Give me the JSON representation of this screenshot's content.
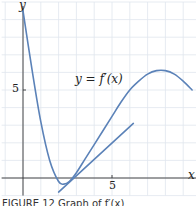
{
  "chart_data": {
    "type": "line",
    "title": "",
    "xlabel": "x",
    "ylabel": "y",
    "x_ticks": [
      5
    ],
    "y_ticks": [
      5
    ],
    "xlim": [
      -1.2,
      9.8
    ],
    "ylim": [
      -1.0,
      10.0
    ],
    "grid": true,
    "series": [
      {
        "name": "y = f'(x)",
        "x": [
          0,
          0.5,
          1.0,
          1.5,
          2.0,
          2.3,
          2.6,
          3.0,
          3.5,
          4.0,
          4.5,
          5.0,
          5.5,
          6.0,
          6.5,
          7.0,
          7.5,
          8.0,
          8.5,
          9.0,
          9.5
        ],
        "y": [
          9.5,
          6.2,
          3.2,
          1.0,
          -0.2,
          -0.35,
          -0.2,
          0.3,
          1.1,
          1.9,
          2.7,
          3.5,
          4.3,
          5.0,
          5.5,
          5.9,
          6.1,
          6.1,
          5.9,
          5.5,
          5.0
        ]
      },
      {
        "name": "tangent line",
        "x": [
          2.0,
          6.2
        ],
        "y": [
          -0.8,
          3.1
        ]
      }
    ],
    "annotations": [
      {
        "text": "y = f′(x)",
        "x": 5.0,
        "y": 5.5
      }
    ]
  },
  "labels": {
    "y_axis": "y",
    "x_axis": "x",
    "y_tick_5": "5",
    "x_tick_5": "5",
    "curve_label_y": "y",
    "curve_label_eq": "=",
    "curve_label_f": "f′(x)",
    "caption": "FIGURE 12  Graph of f′(x)"
  },
  "colors": {
    "curve": "#5b82b8",
    "grid": "#dfe6ee",
    "axis": "#333333"
  }
}
